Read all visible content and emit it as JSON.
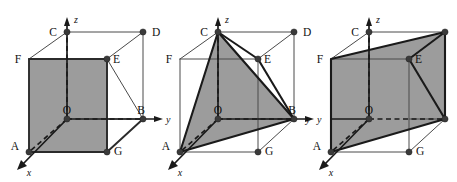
{
  "figure": {
    "background_color": "#ffffff",
    "shade_color": "#9c9c9c",
    "edge_color": "#2b2b2b",
    "vertex_color": "#3a3a3a",
    "panel_count": 3
  },
  "axes": {
    "x_label": "x",
    "y_label": "y",
    "z_label": "z",
    "origin_label": "O"
  },
  "vertex_labels": {
    "A": "A",
    "B": "B",
    "C": "C",
    "D": "D",
    "E": "E",
    "F": "F",
    "G": "G",
    "O": "O"
  },
  "panels": [
    {
      "id": "panel-1",
      "name": "cube-front-face-shaded",
      "shaded_region": "square A-F-E-G (front face)",
      "shaded_vertices": [
        "F",
        "E",
        "G",
        "A"
      ],
      "labels_shown": [
        "C",
        "D",
        "F",
        "E",
        "O",
        "B",
        "A",
        "G",
        "x",
        "y",
        "z"
      ]
    },
    {
      "id": "panel-2",
      "name": "cube-triangle-shaded",
      "shaded_region": "triangle A-C-B through E",
      "shaded_vertices": [
        "A",
        "C",
        "B"
      ],
      "labels_shown": [
        "C",
        "D",
        "F",
        "E",
        "O",
        "B",
        "A",
        "G",
        "x",
        "y",
        "z"
      ]
    },
    {
      "id": "panel-3",
      "name": "cube-parallelogram-shaded",
      "shaded_region": "parallelogram A-F-D-B (diagonal plane)",
      "shaded_vertices": [
        "A",
        "F",
        "D",
        "B"
      ],
      "labels_shown": [
        "C",
        "F",
        "E",
        "O",
        "A",
        "G",
        "x",
        "y",
        "z"
      ]
    }
  ]
}
